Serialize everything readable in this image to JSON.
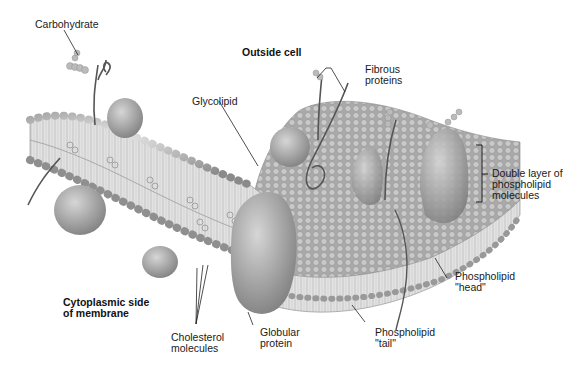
{
  "diagram": {
    "region_labels": {
      "outside": "Outside cell",
      "cytoplasmic": "Cytoplasmic side\nof membrane"
    },
    "labels": {
      "carbohydrate": "Carbohydrate",
      "glycolipid": "Glycolipid",
      "fibrous": "Fibrous\nproteins",
      "double_layer": "Double layer of\nphospholipid\nmolecules",
      "head": "Phospholipid\n\"head\"",
      "tail": "Phospholipid\n\"tail\"",
      "globular": "Globular\nprotein",
      "cholesterol": "Cholesterol\nmolecules"
    },
    "colors": {
      "background": "#ffffff",
      "membrane_light": "#d9d9d9",
      "membrane_mid": "#a8a8a8",
      "membrane_dark": "#6e6e6e",
      "label_line": "#222222"
    }
  }
}
